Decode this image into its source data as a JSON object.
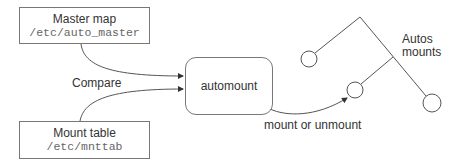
{
  "diagram": {
    "master_map": {
      "title": "Master map",
      "path": "/etc/auto_master"
    },
    "mount_table": {
      "title": "Mount table",
      "path": "/etc/mnttab"
    },
    "automount": {
      "label": "automount"
    },
    "edges": {
      "compare_label": "Compare",
      "mount_label": "mount or unmount"
    },
    "tree": {
      "label_line1": "Autos",
      "label_line2": "mounts",
      "nodes": 3
    },
    "colors": {
      "stroke": "#555555",
      "text": "#333333",
      "mono_text": "#666666"
    }
  }
}
